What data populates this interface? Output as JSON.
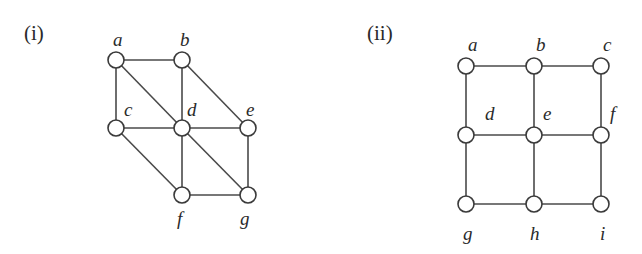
{
  "figures": [
    {
      "id": "i",
      "label": "(i)",
      "label_pos": [
        24,
        40
      ],
      "node_radius": 8,
      "nodes": [
        {
          "id": "a",
          "label": "a",
          "x": 116,
          "y": 60,
          "lx": 113,
          "ly": 46
        },
        {
          "id": "b",
          "label": "b",
          "x": 182,
          "y": 60,
          "lx": 180,
          "ly": 46
        },
        {
          "id": "c",
          "label": "c",
          "x": 116,
          "y": 128,
          "lx": 124,
          "ly": 116
        },
        {
          "id": "d",
          "label": "d",
          "x": 182,
          "y": 128,
          "lx": 187,
          "ly": 116
        },
        {
          "id": "e",
          "label": "e",
          "x": 248,
          "y": 128,
          "lx": 246,
          "ly": 116
        },
        {
          "id": "f",
          "label": "f",
          "x": 182,
          "y": 195,
          "lx": 177,
          "ly": 225
        },
        {
          "id": "g",
          "label": "g",
          "x": 248,
          "y": 195,
          "lx": 240,
          "ly": 225
        }
      ],
      "edges": [
        [
          "a",
          "b"
        ],
        [
          "a",
          "c"
        ],
        [
          "a",
          "d"
        ],
        [
          "b",
          "d"
        ],
        [
          "b",
          "e"
        ],
        [
          "c",
          "d"
        ],
        [
          "d",
          "e"
        ],
        [
          "c",
          "f"
        ],
        [
          "d",
          "f"
        ],
        [
          "d",
          "g"
        ],
        [
          "e",
          "g"
        ],
        [
          "f",
          "g"
        ]
      ]
    },
    {
      "id": "ii",
      "label": "(ii)",
      "label_pos": [
        367,
        40
      ],
      "node_radius": 8,
      "nodes": [
        {
          "id": "a",
          "label": "a",
          "x": 466,
          "y": 66,
          "lx": 468,
          "ly": 51
        },
        {
          "id": "b",
          "label": "b",
          "x": 534,
          "y": 66,
          "lx": 536,
          "ly": 51
        },
        {
          "id": "c",
          "label": "c",
          "x": 601,
          "y": 66,
          "lx": 603,
          "ly": 51
        },
        {
          "id": "d",
          "label": "d",
          "x": 466,
          "y": 135,
          "lx": 485,
          "ly": 120
        },
        {
          "id": "e",
          "label": "e",
          "x": 534,
          "y": 135,
          "lx": 543,
          "ly": 120
        },
        {
          "id": "f",
          "label": "f",
          "x": 601,
          "y": 135,
          "lx": 610,
          "ly": 120
        },
        {
          "id": "g",
          "label": "g",
          "x": 466,
          "y": 204,
          "lx": 463,
          "ly": 240
        },
        {
          "id": "h",
          "label": "h",
          "x": 534,
          "y": 204,
          "lx": 530,
          "ly": 240
        },
        {
          "id": "i",
          "label": "i",
          "x": 601,
          "y": 204,
          "lx": 600,
          "ly": 240
        }
      ],
      "edges": [
        [
          "a",
          "b"
        ],
        [
          "b",
          "c"
        ],
        [
          "a",
          "d"
        ],
        [
          "b",
          "e"
        ],
        [
          "c",
          "f"
        ],
        [
          "d",
          "e"
        ],
        [
          "e",
          "f"
        ],
        [
          "d",
          "g"
        ],
        [
          "e",
          "h"
        ],
        [
          "f",
          "i"
        ],
        [
          "g",
          "h"
        ],
        [
          "h",
          "i"
        ]
      ]
    }
  ]
}
